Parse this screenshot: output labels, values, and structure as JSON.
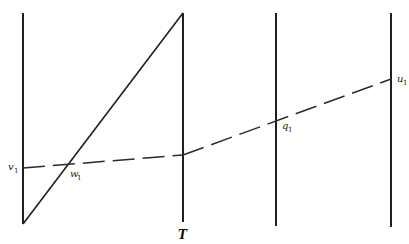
{
  "diagram": {
    "labels": {
      "v": {
        "base": "v",
        "sub": "1"
      },
      "w": {
        "base": "w",
        "sub": "1"
      },
      "q": {
        "base": "q",
        "sub": "1"
      },
      "u": {
        "base": "u",
        "sub": "1"
      },
      "T": "T"
    },
    "vertical_lines": [
      "line-1",
      "line-T",
      "line-3",
      "line-4"
    ]
  }
}
